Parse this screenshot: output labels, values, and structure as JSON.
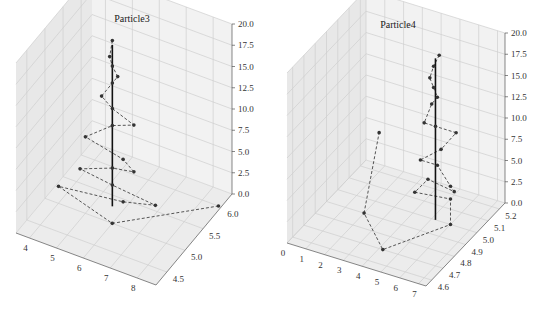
{
  "figure": {
    "width": 547,
    "height": 310,
    "background": "#ffffff"
  },
  "chart_data": [
    {
      "type": "scatter3d-line",
      "title": "Particle3",
      "xlabel": "",
      "ylabel": "",
      "zlabel": "",
      "x_ticks": [
        "4",
        "5",
        "6",
        "7",
        "8"
      ],
      "y_ticks": [
        "4.5",
        "5.0",
        "5.5",
        "6.0"
      ],
      "z_ticks": [
        "0.0",
        "2.5",
        "5.0",
        "7.5",
        "10.0",
        "12.5",
        "15.0",
        "17.5",
        "20.0"
      ],
      "xlim": [
        3.5,
        8.7
      ],
      "ylim": [
        4.2,
        6.3
      ],
      "zlim": [
        0,
        20
      ],
      "grid": true,
      "vertical_line": {
        "x": 5.6,
        "y": 5.3,
        "z": [
          0,
          19
        ],
        "color": "#111111",
        "style": "solid"
      },
      "trajectory": {
        "style": "dashed",
        "marker": "o",
        "color": "#555555",
        "points": [
          {
            "x": 5.6,
            "y": 5.3,
            "z": 19.5
          },
          {
            "x": 5.5,
            "y": 5.3,
            "z": 17.5
          },
          {
            "x": 5.6,
            "y": 5.3,
            "z": 16.5
          },
          {
            "x": 5.8,
            "y": 5.3,
            "z": 15.5
          },
          {
            "x": 5.6,
            "y": 5.3,
            "z": 14.5
          },
          {
            "x": 5.2,
            "y": 5.3,
            "z": 12.5
          },
          {
            "x": 5.6,
            "y": 5.3,
            "z": 11.5
          },
          {
            "x": 6.4,
            "y": 5.3,
            "z": 10.5
          },
          {
            "x": 5.6,
            "y": 5.3,
            "z": 9.5
          },
          {
            "x": 4.6,
            "y": 5.3,
            "z": 7.0
          },
          {
            "x": 6.0,
            "y": 5.3,
            "z": 6.0
          },
          {
            "x": 6.4,
            "y": 5.3,
            "z": 5.0
          },
          {
            "x": 5.6,
            "y": 5.3,
            "z": 4.5
          },
          {
            "x": 4.4,
            "y": 5.3,
            "z": 3.0
          },
          {
            "x": 5.6,
            "y": 5.3,
            "z": 2.5
          },
          {
            "x": 7.2,
            "y": 5.3,
            "z": 2.0
          },
          {
            "x": 6.0,
            "y": 5.3,
            "z": 1.0
          },
          {
            "x": 3.6,
            "y": 5.3,
            "z": 0.0
          },
          {
            "x": 6.0,
            "y": 5.0,
            "z": 0.0
          },
          {
            "x": 8.6,
            "y": 6.0,
            "z": 0.0
          }
        ]
      }
    },
    {
      "type": "scatter3d-line",
      "title": "Particle4",
      "xlabel": "",
      "ylabel": "",
      "zlabel": "",
      "x_ticks": [
        "0",
        "1",
        "2",
        "3",
        "4",
        "5",
        "6",
        "7"
      ],
      "y_ticks": [
        "4.6",
        "4.7",
        "4.8",
        "4.9",
        "5.0",
        "5.1",
        "5.2"
      ],
      "z_ticks": [
        "0.0",
        "2.5",
        "5.0",
        "7.5",
        "10.0",
        "12.5",
        "15.0",
        "17.5",
        "20.0"
      ],
      "xlim": [
        0,
        7.4
      ],
      "ylim": [
        4.55,
        5.25
      ],
      "zlim": [
        0,
        20
      ],
      "grid": true,
      "vertical_line": {
        "x": 5.2,
        "y": 5.0,
        "z": [
          0,
          19
        ],
        "color": "#111111",
        "style": "solid"
      },
      "trajectory": {
        "style": "dashed",
        "marker": "o",
        "color": "#555555",
        "points": [
          {
            "x": 5.4,
            "y": 5.0,
            "z": 19.5
          },
          {
            "x": 5.1,
            "y": 5.0,
            "z": 18.0
          },
          {
            "x": 4.9,
            "y": 5.0,
            "z": 16.5
          },
          {
            "x": 5.1,
            "y": 5.0,
            "z": 15.5
          },
          {
            "x": 5.3,
            "y": 5.0,
            "z": 14.5
          },
          {
            "x": 5.0,
            "y": 5.0,
            "z": 13.5
          },
          {
            "x": 4.6,
            "y": 5.0,
            "z": 11.0
          },
          {
            "x": 5.2,
            "y": 5.0,
            "z": 11.0
          },
          {
            "x": 6.3,
            "y": 5.0,
            "z": 11.0
          },
          {
            "x": 5.5,
            "y": 5.0,
            "z": 8.5
          },
          {
            "x": 4.4,
            "y": 5.0,
            "z": 6.5
          },
          {
            "x": 5.3,
            "y": 5.0,
            "z": 6.5
          },
          {
            "x": 6.0,
            "y": 5.0,
            "z": 4.5
          },
          {
            "x": 6.2,
            "y": 5.0,
            "z": 4.0
          },
          {
            "x": 4.8,
            "y": 5.0,
            "z": 4.5
          },
          {
            "x": 4.1,
            "y": 5.0,
            "z": 2.5
          },
          {
            "x": 6.0,
            "y": 5.0,
            "z": 3.0
          },
          {
            "x": 6.0,
            "y": 5.0,
            "z": 0.0
          },
          {
            "x": 4.2,
            "y": 4.7,
            "z": 0.0
          },
          {
            "x": 2.0,
            "y": 4.9,
            "z": 0.0
          },
          {
            "x": 1.3,
            "y": 5.15,
            "z": 5.5
          }
        ]
      }
    }
  ],
  "panels_layout": [
    {
      "title_pos": [
        132,
        22
      ],
      "origin": [
        47,
        233
      ],
      "x_axis_end": [
        158,
        283
      ],
      "y_axis_end": [
        232,
        203
      ],
      "z_height": 165,
      "back_corner_top": [
        82,
        36
      ]
    },
    {
      "title_pos": [
        398,
        28
      ],
      "origin": [
        17,
        243
      ],
      "x_axis_end": [
        153,
        286
      ],
      "y_axis_end": [
        232,
        210
      ],
      "z_height": 165,
      "back_corner_top": [
        36,
        38
      ]
    }
  ]
}
